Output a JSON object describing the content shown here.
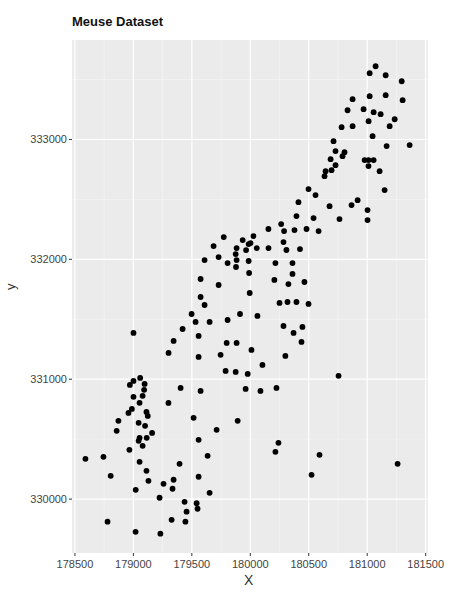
{
  "chart_data": {
    "type": "scatter",
    "title": "Meuse Dataset",
    "xlabel": "X",
    "ylabel": "y",
    "xlim": [
      178475,
      181520
    ],
    "ylim": [
      329550,
      333830
    ],
    "x_ticks": [
      178500,
      179000,
      179500,
      180000,
      180500,
      181000,
      181500
    ],
    "y_ticks": [
      330000,
      331000,
      332000,
      333000
    ],
    "x_tick_labels": [
      "178500",
      "179000",
      "179500",
      "180000",
      "180500",
      "181000",
      "181500"
    ],
    "y_tick_labels": [
      "330000",
      "331000",
      "332000",
      "333000"
    ],
    "grid": true,
    "legend": null,
    "point_color": "#000000",
    "background": "#ebebeb",
    "points": [
      [
        181072,
        333611
      ],
      [
        181021,
        333553
      ],
      [
        181158,
        333536
      ],
      [
        181295,
        333486
      ],
      [
        181021,
        333361
      ],
      [
        181158,
        333370
      ],
      [
        180875,
        333336
      ],
      [
        181303,
        333328
      ],
      [
        180832,
        333244
      ],
      [
        180969,
        333253
      ],
      [
        181055,
        333228
      ],
      [
        181115,
        333211
      ],
      [
        181012,
        333153
      ],
      [
        181235,
        333169
      ],
      [
        181192,
        333111
      ],
      [
        180781,
        333103
      ],
      [
        180875,
        333111
      ],
      [
        181046,
        333028
      ],
      [
        180712,
        332986
      ],
      [
        181363,
        332953
      ],
      [
        181166,
        332945
      ],
      [
        180806,
        332894
      ],
      [
        180789,
        332861
      ],
      [
        180729,
        332903
      ],
      [
        181011,
        332828
      ],
      [
        180687,
        332836
      ],
      [
        180729,
        332786
      ],
      [
        180978,
        332828
      ],
      [
        181055,
        332828
      ],
      [
        180644,
        332736
      ],
      [
        180695,
        332744
      ],
      [
        180635,
        332694
      ],
      [
        181011,
        332778
      ],
      [
        181106,
        332736
      ],
      [
        180498,
        332586
      ],
      [
        180558,
        332536
      ],
      [
        181149,
        332578
      ],
      [
        180412,
        332477
      ],
      [
        180918,
        332494
      ],
      [
        180866,
        332453
      ],
      [
        180678,
        332444
      ],
      [
        181003,
        332411
      ],
      [
        181003,
        332328
      ],
      [
        180541,
        332344
      ],
      [
        180763,
        332336
      ],
      [
        180395,
        332361
      ],
      [
        180481,
        332253
      ],
      [
        180584,
        332236
      ],
      [
        180264,
        332294
      ],
      [
        180289,
        332236
      ],
      [
        180378,
        332244
      ],
      [
        180027,
        332194
      ],
      [
        180155,
        332253
      ],
      [
        180002,
        332136
      ],
      [
        180284,
        332144
      ],
      [
        180156,
        332094
      ],
      [
        180055,
        332094
      ],
      [
        180309,
        332078
      ],
      [
        180425,
        332086
      ],
      [
        179964,
        332077
      ],
      [
        179875,
        332044
      ],
      [
        179806,
        331969
      ],
      [
        179986,
        331986
      ],
      [
        180215,
        331969
      ],
      [
        180361,
        331969
      ],
      [
        179878,
        331936
      ],
      [
        179990,
        331886
      ],
      [
        180361,
        331878
      ],
      [
        180206,
        331828
      ],
      [
        180326,
        331794
      ],
      [
        180463,
        331811
      ],
      [
        179995,
        331719
      ],
      [
        180318,
        331644
      ],
      [
        180395,
        331644
      ],
      [
        180250,
        331636
      ],
      [
        180498,
        331628
      ],
      [
        179912,
        331544
      ],
      [
        180061,
        331528
      ],
      [
        180446,
        331436
      ],
      [
        180370,
        331386
      ],
      [
        180284,
        331444
      ],
      [
        180438,
        331311
      ],
      [
        180010,
        331244
      ],
      [
        180300,
        331194
      ],
      [
        179773,
        332186
      ],
      [
        179935,
        332161
      ],
      [
        179986,
        332127
      ],
      [
        179686,
        332111
      ],
      [
        179883,
        332094
      ],
      [
        179609,
        331994
      ],
      [
        179729,
        332019
      ],
      [
        179883,
        331994
      ],
      [
        179575,
        331836
      ],
      [
        179729,
        331786
      ],
      [
        179575,
        331686
      ],
      [
        179609,
        331619
      ],
      [
        179498,
        331544
      ],
      [
        179532,
        331478
      ],
      [
        179652,
        331478
      ],
      [
        179806,
        331494
      ],
      [
        179421,
        331419
      ],
      [
        179558,
        331361
      ],
      [
        179001,
        331386
      ],
      [
        179344,
        331319
      ],
      [
        179798,
        331303
      ],
      [
        179883,
        331303
      ],
      [
        179301,
        331219
      ],
      [
        179558,
        331186
      ],
      [
        179746,
        331203
      ],
      [
        180104,
        331119
      ],
      [
        179789,
        331069
      ],
      [
        179875,
        331061
      ],
      [
        179978,
        331044
      ],
      [
        179404,
        330927
      ],
      [
        179575,
        330902
      ],
      [
        179960,
        330919
      ],
      [
        180087,
        330902
      ],
      [
        180224,
        330927
      ],
      [
        179515,
        330678
      ],
      [
        179892,
        330653
      ],
      [
        179712,
        330578
      ],
      [
        179558,
        330494
      ],
      [
        180241,
        330469
      ],
      [
        179635,
        330361
      ],
      [
        179395,
        330294
      ],
      [
        179558,
        330186
      ],
      [
        179344,
        330161
      ],
      [
        179652,
        330052
      ],
      [
        179438,
        329977
      ],
      [
        179549,
        329919
      ],
      [
        179327,
        329827
      ],
      [
        180524,
        330202
      ],
      [
        181260,
        330294
      ],
      [
        180755,
        331028
      ],
      [
        180215,
        330394
      ],
      [
        180592,
        330369
      ],
      [
        179001,
        330986
      ],
      [
        179058,
        331011
      ],
      [
        179096,
        330961
      ],
      [
        178970,
        330952
      ],
      [
        179092,
        330911
      ],
      [
        179079,
        330861
      ],
      [
        179001,
        330853
      ],
      [
        179053,
        330803
      ],
      [
        178987,
        330752
      ],
      [
        178958,
        330719
      ],
      [
        179112,
        330727
      ],
      [
        178872,
        330653
      ],
      [
        179045,
        330636
      ],
      [
        179123,
        330694
      ],
      [
        179045,
        330486
      ],
      [
        179114,
        330511
      ],
      [
        178857,
        330569
      ],
      [
        179053,
        330511
      ],
      [
        178744,
        330352
      ],
      [
        178966,
        330411
      ],
      [
        179079,
        330444
      ],
      [
        178590,
        330336
      ],
      [
        179053,
        330311
      ],
      [
        179112,
        330236
      ],
      [
        179129,
        330152
      ],
      [
        179258,
        330127
      ],
      [
        178779,
        329811
      ],
      [
        179019,
        329727
      ],
      [
        179231,
        329711
      ],
      [
        179445,
        329811
      ],
      [
        179020,
        330077
      ],
      [
        179224,
        330011
      ],
      [
        179335,
        330086
      ],
      [
        179455,
        329895
      ],
      [
        179541,
        329965
      ],
      [
        178806,
        330194
      ],
      [
        179100,
        330611
      ],
      [
        179160,
        330552
      ],
      [
        179300,
        330802
      ]
    ]
  }
}
